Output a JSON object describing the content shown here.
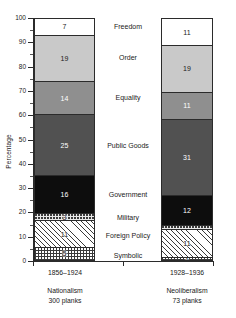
{
  "chart_data": {
    "type": "bar",
    "subtype": "stacked-bar-100",
    "title": "",
    "xlabel": "",
    "ylabel": "Percentage",
    "ylim": [
      0,
      100
    ],
    "grid": false,
    "legend_position": "center-inline",
    "y_ticks": [
      0,
      10,
      20,
      30,
      40,
      50,
      60,
      70,
      80,
      90,
      100
    ],
    "categories": [
      "1856–1924",
      "1928–1936"
    ],
    "category_names": [
      "Nationalism",
      "Neoliberalism"
    ],
    "category_counts": [
      "300 planks",
      "73 planks"
    ],
    "stack_order_bottom_to_top": [
      "Symbolic",
      "Foreign Policy",
      "Military",
      "Government",
      "Public Goods",
      "Equality",
      "Order",
      "Freedom"
    ],
    "series": [
      {
        "name": "Symbolic",
        "values": [
          5,
          1
        ],
        "fill": "grid"
      },
      {
        "name": "Foreign Policy",
        "values": [
          11,
          11
        ],
        "fill": "hatch"
      },
      {
        "name": "Military",
        "values": [
          3,
          2
        ],
        "fill": "dots"
      },
      {
        "name": "Government",
        "values": [
          16,
          12
        ],
        "fill": "black"
      },
      {
        "name": "Public Goods",
        "values": [
          25,
          31
        ],
        "fill": "dark"
      },
      {
        "name": "Equality",
        "values": [
          14,
          11
        ],
        "fill": "medium"
      },
      {
        "name": "Order",
        "values": [
          19,
          19
        ],
        "fill": "light"
      },
      {
        "name": "Freedom",
        "values": [
          7,
          11
        ],
        "fill": "white"
      }
    ]
  },
  "axis": {
    "y_title": "Percentage",
    "ticks": [
      "100",
      "90",
      "80",
      "70",
      "60",
      "50",
      "40",
      "30",
      "20",
      "10",
      "0"
    ]
  },
  "category_labels": {
    "freedom": "Freedom",
    "order": "Order",
    "equality": "Equality",
    "public_goods": "Public Goods",
    "government": "Government",
    "military": "Military",
    "foreign_policy": "Foreign Policy",
    "symbolic": "Symbolic"
  },
  "bars": {
    "left": {
      "period": "1856–1924",
      "name": "Nationalism",
      "count": "300 planks",
      "segments": [
        {
          "key": "freedom",
          "value": 7,
          "label": "7"
        },
        {
          "key": "order",
          "value": 19,
          "label": "19"
        },
        {
          "key": "equality",
          "value": 14,
          "label": "14"
        },
        {
          "key": "public_goods",
          "value": 25,
          "label": "25"
        },
        {
          "key": "government",
          "value": 16,
          "label": "16"
        },
        {
          "key": "military",
          "value": 3,
          "label": "3"
        },
        {
          "key": "foreign_policy",
          "value": 11,
          "label": "11"
        },
        {
          "key": "symbolic",
          "value": 5,
          "label": "5"
        }
      ]
    },
    "right": {
      "period": "1928–1936",
      "name": "Neoliberalism",
      "count": "73 planks",
      "segments": [
        {
          "key": "freedom",
          "value": 11,
          "label": "11"
        },
        {
          "key": "order",
          "value": 19,
          "label": "19"
        },
        {
          "key": "equality",
          "value": 11,
          "label": "11"
        },
        {
          "key": "public_goods",
          "value": 31,
          "label": "31"
        },
        {
          "key": "government",
          "value": 12,
          "label": "12"
        },
        {
          "key": "military",
          "value": 2,
          "label": ""
        },
        {
          "key": "foreign_policy",
          "value": 11,
          "label": "11"
        },
        {
          "key": "symbolic",
          "value": 1,
          "label": "1"
        }
      ]
    }
  },
  "colors": {
    "white": "#ffffff",
    "light": "#c9c9c9",
    "medium": "#8f8f8f",
    "dark": "#515151",
    "black": "#0d0d0d",
    "axis": "#2b2b2b"
  }
}
